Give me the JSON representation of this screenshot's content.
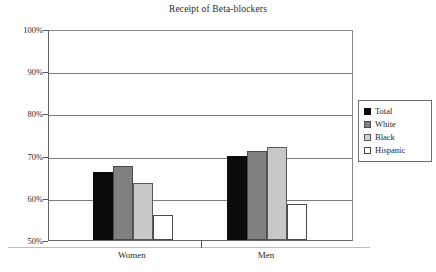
{
  "chart_data": {
    "type": "bar",
    "title": "Receipt of Beta-blockers",
    "xlabel": "",
    "ylabel": "",
    "categories": [
      "Women",
      "Men"
    ],
    "series": [
      {
        "name": "Total",
        "color": "#0c0c0c",
        "values": [
          66.0,
          70.0
        ]
      },
      {
        "name": "White",
        "color": "#808080",
        "values": [
          67.5,
          71.0
        ]
      },
      {
        "name": "Black",
        "color": "#c8c8c8",
        "values": [
          63.5,
          72.0
        ]
      },
      {
        "name": "Hispanic",
        "color": "#ffffff",
        "values": [
          56.0,
          58.5
        ]
      }
    ],
    "ylim": [
      50,
      100
    ],
    "ytick_labels": [
      "100%",
      "90%",
      "80%",
      "70%",
      "60%",
      "50%"
    ],
    "ytick_values": [
      100,
      90,
      80,
      70,
      60,
      50
    ],
    "grid": true,
    "legend_position": "right",
    "value_suffix": "%"
  },
  "legend": {
    "items": [
      {
        "label": "Total",
        "swatch": "total"
      },
      {
        "label": "White",
        "swatch": "white"
      },
      {
        "label": "Black",
        "swatch": "black"
      },
      {
        "label": "Hispanic",
        "swatch": "hispanic"
      }
    ]
  }
}
